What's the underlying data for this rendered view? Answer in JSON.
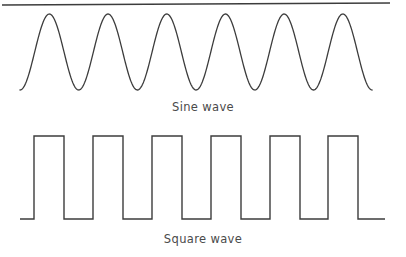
{
  "figure": {
    "background_color": "#ffffff",
    "stroke_color": "#3c3c3c",
    "caption_color": "#4a4a4a",
    "width": 406,
    "height": 257
  },
  "top_rule": {
    "name": "top-divider-rule",
    "x1": 2,
    "y1": 5,
    "x2": 390,
    "y2": 3,
    "stroke_width": 1.6
  },
  "sine": {
    "caption": "Sine wave",
    "cycles": 6,
    "x_start": 20,
    "x_end": 372,
    "peak_y": 14,
    "trough_y": 90,
    "period": 58.7,
    "peaks_x": [
      49,
      108,
      167,
      226,
      285,
      344
    ],
    "stroke_width": 1.3
  },
  "square": {
    "caption": "Square wave",
    "pulses": 6,
    "x_start": 20,
    "x_end": 385,
    "high_y": 136,
    "low_y": 219,
    "stroke_width": 1.4,
    "pulse_spans": [
      [
        34,
        64
      ],
      [
        93,
        123
      ],
      [
        152,
        182
      ],
      [
        211,
        241
      ],
      [
        270,
        300
      ],
      [
        328,
        358
      ]
    ]
  },
  "chart_data": {
    "type": "line",
    "title": "",
    "xlabel": "",
    "ylabel": "",
    "grid": false,
    "legend_position": "below-each-plot",
    "series": [
      {
        "name": "Sine wave",
        "waveform": "sine",
        "cycles": 6,
        "amplitude": 1,
        "samples_per_cycle": 48,
        "phase_deg": 270,
        "pixel_top": 14,
        "pixel_bottom": 90
      },
      {
        "name": "Square wave",
        "waveform": "square",
        "cycles": 6,
        "duty_cycle": 0.5,
        "amplitude": 1,
        "pixel_high": 136,
        "pixel_low": 219
      }
    ]
  }
}
